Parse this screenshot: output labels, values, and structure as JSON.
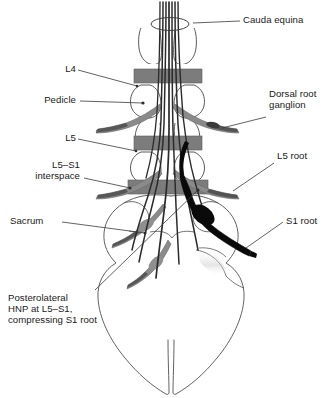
{
  "figure": {
    "background": "#ffffff",
    "ink": "#1a1a1a",
    "colors": {
      "outline": "#5a5a5a",
      "disc_gray": "#7c7c7c",
      "root_gray": "#8a8a8a",
      "root_dark": "#4e4e4e",
      "herniated_root": "#0a0a0a",
      "cauda_fiber": "#2b2b2b",
      "leader": "#3a3a3a"
    }
  },
  "labels": {
    "cauda_equina": "Cauda equina",
    "l4": "L4",
    "pedicle": "Pedicle",
    "l5": "L5",
    "l5_s1_interspace_line1": "L5–S1",
    "l5_s1_interspace_line2": "interspace",
    "dorsal_root_ganglion_line1": "Dorsal root",
    "dorsal_root_ganglion_line2": "ganglion",
    "l5_root": "L5 root",
    "s1_root": "S1 root",
    "sacrum": "Sacrum",
    "hnp_line1": "Posterolateral",
    "hnp_line2": "HNP at L5–S1,",
    "hnp_line3": "compressing S1 root"
  },
  "anatomy": {
    "levels": [
      "L4",
      "L5",
      "S1"
    ],
    "discs": [
      "L4 disc",
      "L5 disc",
      "L5–S1 disc"
    ],
    "cauda_equina_fiber_count": 7,
    "nerve_root_pairs": 4,
    "compressed_root": "S1 root",
    "herniation_site": "L5–S1 posterolateral",
    "herniation_side": "right"
  }
}
